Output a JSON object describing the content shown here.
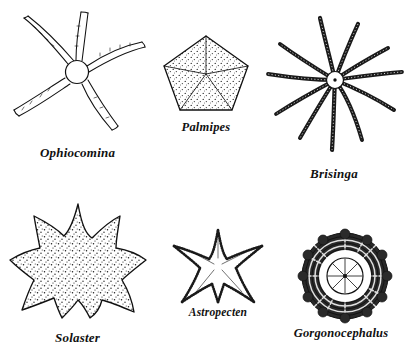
{
  "plate": {
    "kind": "scientific-illustration-plate",
    "subject": "echinoderms",
    "background_color": "#ffffff",
    "ink_color": "#111111",
    "columns": 3,
    "rows": 2
  },
  "figures": [
    {
      "id": "ophiocomina",
      "label": "Ophiocomina",
      "common_group": "brittle star",
      "arm_count": 5,
      "form": "small round central disc with five long slender tapering arms",
      "texture": "fine line work, bristled arm edges",
      "position": "top-left"
    },
    {
      "id": "palmipes",
      "label": "Palmipes",
      "common_group": "cushion star",
      "arm_count": 5,
      "form": "flat pentagonal disc divided into five triangular sectors",
      "texture": "dense stipple",
      "position": "top-center"
    },
    {
      "id": "brisinga",
      "label": "Brisinga",
      "common_group": "sea star",
      "arm_count": 11,
      "form": "tiny central disc with many long segmented whip-like arms",
      "texture": "beaded segmented arms",
      "position": "top-right"
    },
    {
      "id": "solaster",
      "label": "Solaster",
      "common_group": "sun star",
      "arm_count": 9,
      "form": "broad body with nine short triangular rays",
      "texture": "even stipple over whole body",
      "position": "bottom-left"
    },
    {
      "id": "astropecten",
      "label": "Astropecten",
      "common_group": "sand star",
      "arm_count": 5,
      "form": "five tapering arms with beaded marginal plates",
      "texture": "beaded margins, open interior",
      "position": "bottom-center"
    },
    {
      "id": "gorgonocephalus",
      "label": "Gorgonocephalus",
      "common_group": "basket star",
      "arm_count": 5,
      "form": "pale central disc ringed by a dense mass of branching arms",
      "texture": "heavy dark tangled branches",
      "position": "bottom-right"
    }
  ]
}
